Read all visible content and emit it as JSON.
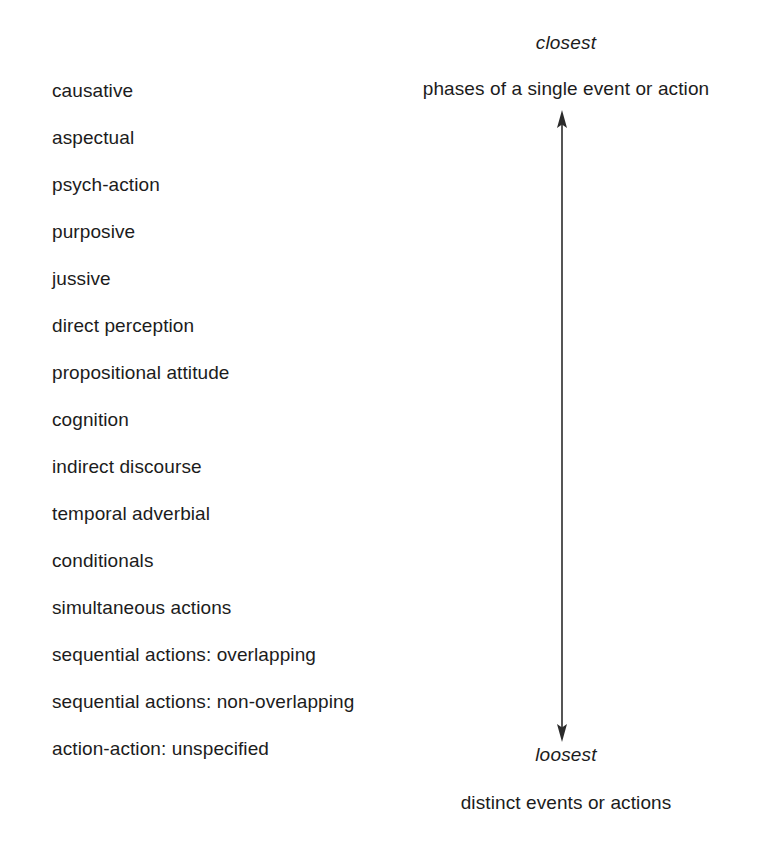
{
  "figure": {
    "background_color": "#ffffff",
    "text_color": "#1c1c1c",
    "arrow_color": "#2b2b2b"
  },
  "scale": {
    "top": {
      "name": "closest",
      "gloss": "phases of a single event or action"
    },
    "bottom": {
      "name": "loosest",
      "gloss": "distinct events or actions"
    },
    "arrow": {
      "orientation": "vertical",
      "heads": "both",
      "label": "interclausal-relations-cline"
    }
  },
  "types": [
    {
      "label": "causative"
    },
    {
      "label": "aspectual"
    },
    {
      "label": "psych-action"
    },
    {
      "label": "purposive"
    },
    {
      "label": "jussive"
    },
    {
      "label": "direct perception"
    },
    {
      "label": "propositional attitude"
    },
    {
      "label": "cognition"
    },
    {
      "label": "indirect discourse"
    },
    {
      "label": "temporal adverbial"
    },
    {
      "label": "conditionals"
    },
    {
      "label": "simultaneous actions"
    },
    {
      "label": "sequential actions: overlapping"
    },
    {
      "label": "sequential actions: non-overlapping"
    },
    {
      "label": "action-action: unspecified"
    }
  ]
}
